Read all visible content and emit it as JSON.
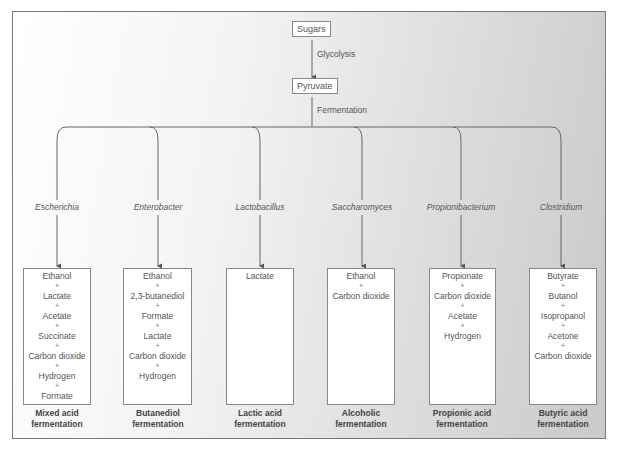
{
  "diagram": {
    "start_node": "Sugars",
    "step1_label": "Glycolysis",
    "middle_node": "Pyruvate",
    "step2_label": "Fermentation",
    "branches": [
      {
        "organism": "Escherichia",
        "products": [
          "Ethanol",
          "Lactate",
          "Acetate",
          "Succinate",
          "Carbon dioxide",
          "Hydrogen",
          "Formate"
        ],
        "type_line1": "Mixed acid",
        "type_line2": "fermentation"
      },
      {
        "organism": "Enterobacter",
        "products": [
          "Ethanol",
          "2,3-butanediol",
          "Formate",
          "Lactate",
          "Carbon dioxide",
          "Hydrogen"
        ],
        "type_line1": "Butanediol",
        "type_line2": "fermentation"
      },
      {
        "organism": "Lactobacillus",
        "products": [
          "Lactate"
        ],
        "type_line1": "Lactic acid",
        "type_line2": "fermentation"
      },
      {
        "organism": "Saccharomyces",
        "products": [
          "Ethanol",
          "Carbon dioxide"
        ],
        "type_line1": "Alcoholic",
        "type_line2": "fermentation"
      },
      {
        "organism": "Propionibacterium",
        "products": [
          "Propionate",
          "Carbon dioxide",
          "Acetate",
          "Hydrogen"
        ],
        "type_line1": "Propionic acid",
        "type_line2": "fermentation"
      },
      {
        "organism": "Clostridium",
        "products": [
          "Butyrate",
          "Butanol",
          "Isopropanol",
          "Acetone",
          "Carbon dioxide"
        ],
        "type_line1": "Butyric acid",
        "type_line2": "fermentation"
      }
    ],
    "separator": "+"
  }
}
